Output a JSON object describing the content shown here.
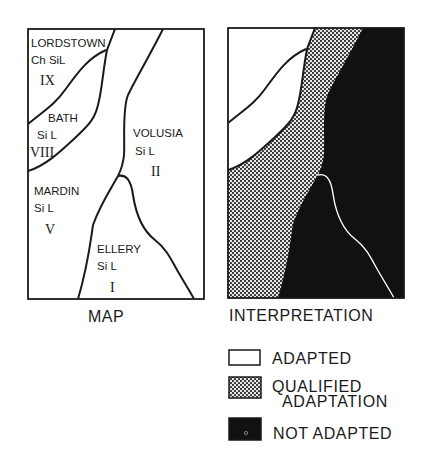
{
  "map": {
    "caption": "MAP",
    "regions": [
      {
        "name": "LORDSTOWN",
        "texture": "Ch SiL",
        "class": "IX"
      },
      {
        "name": "BATH",
        "texture": "Si L",
        "class": "VIII"
      },
      {
        "name": "VOLUSIA",
        "texture": "Si L",
        "class": "II"
      },
      {
        "name": "MARDIN",
        "texture": "Si L",
        "class": "V"
      },
      {
        "name": "ELLERY",
        "texture": "Si L",
        "class": "I"
      }
    ]
  },
  "interpretation": {
    "caption": "INTERPRETATION",
    "legend": [
      {
        "label": "ADAPTED",
        "pattern": "white"
      },
      {
        "label_line1": "QUALIFIED",
        "label_line2": "ADAPTATION",
        "pattern": "dotted"
      },
      {
        "label": "NOT ADAPTED",
        "pattern": "black"
      }
    ]
  },
  "colors": {
    "ink": "#1a1a1a",
    "black_fill": "#111111",
    "paper": "#ffffff"
  }
}
